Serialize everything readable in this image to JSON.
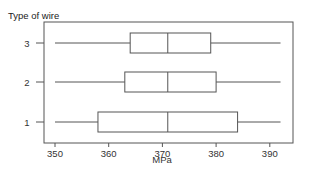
{
  "chart_data": {
    "type": "boxplot",
    "orientation": "horizontal",
    "title": "",
    "xlabel": "MPa",
    "ylabel": "Type of wire",
    "xlim": [
      348,
      395
    ],
    "xticks": [
      350,
      360,
      370,
      380,
      390
    ],
    "categories": [
      "1",
      "2",
      "3"
    ],
    "series": [
      {
        "name": "1",
        "min": 350,
        "q1": 358,
        "median": 371,
        "q3": 384,
        "max": 392
      },
      {
        "name": "2",
        "min": 350,
        "q1": 363,
        "median": 371,
        "q3": 380,
        "max": 392
      },
      {
        "name": "3",
        "min": 350,
        "q1": 364,
        "median": 371,
        "q3": 379,
        "max": 392
      }
    ],
    "grid": false,
    "legend": "none"
  },
  "colors": {
    "line": "#555555",
    "frame": "#444444",
    "text": "#333333"
  }
}
